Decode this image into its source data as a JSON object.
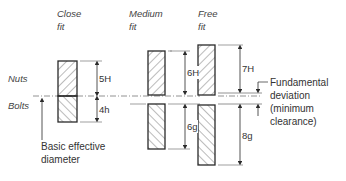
{
  "diagram": {
    "columns": [
      {
        "title_line1": "Close",
        "title_line2": "fit",
        "nut_tolerance": "5H",
        "bolt_tolerance": "4h"
      },
      {
        "title_line1": "Medium",
        "title_line2": "fit",
        "nut_tolerance": "6H",
        "bolt_tolerance": "6g"
      },
      {
        "title_line1": "Free",
        "title_line2": "fit",
        "nut_tolerance": "7H",
        "bolt_tolerance": "8g"
      }
    ],
    "row_labels": {
      "nuts": "Nuts",
      "bolts": "Bolts"
    },
    "basic_diameter": {
      "line1": "Basic effective",
      "line2": "diameter"
    },
    "fundamental_deviation": {
      "line1": "Fundamental",
      "line2": "deviation",
      "line3": "(minimum",
      "line4": "clearance)"
    },
    "colors": {
      "stroke": "#2a2a2a",
      "hatch": "#555555",
      "text": "#333333"
    }
  }
}
